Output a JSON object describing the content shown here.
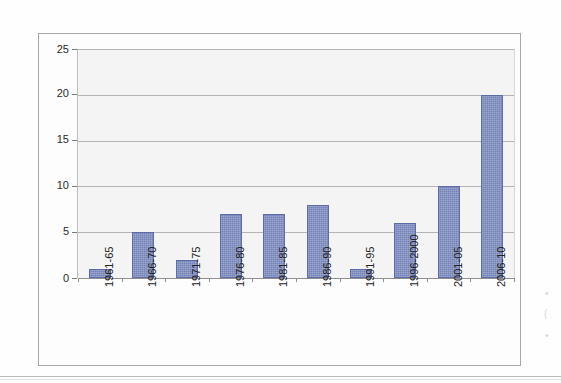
{
  "chart_data": {
    "type": "bar",
    "title": "",
    "subtitle": "",
    "xlabel": "",
    "ylabel": "",
    "categories": [
      "1961-65",
      "1966-70",
      "1971-75",
      "1976-80",
      "1981-85",
      "1986-90",
      "1991-95",
      "1996-2000",
      "2001-05",
      "2006-10"
    ],
    "values": [
      1,
      5,
      2,
      7,
      7,
      8,
      1,
      6,
      10,
      20
    ],
    "series": [
      {
        "name": "",
        "values": [
          1,
          5,
          2,
          7,
          7,
          8,
          1,
          6,
          10,
          20
        ]
      }
    ],
    "ylim": [
      0,
      25
    ],
    "ytick_labels": [
      "0",
      "5",
      "10",
      "15",
      "20",
      "25"
    ],
    "ytick_values": [
      0,
      5,
      10,
      15,
      20,
      25
    ],
    "grid": "horizontal",
    "legend": "none",
    "annotations": [],
    "colors": {
      "bar_fill": "#7382b8",
      "bar_border": "#5d6ca6",
      "plot_background": "#f4f4f4",
      "gridline": "#b4b4b4",
      "axis": "#8f8f8f",
      "frame_border": "#a8a8a8",
      "page_background": "#fefefe",
      "tick_label": "#2b2b2b"
    },
    "xlabel_rotation": -90
  },
  "scan": {
    "noise_marks": [
      "•",
      "(",
      "•",
      "·",
      "·"
    ]
  }
}
